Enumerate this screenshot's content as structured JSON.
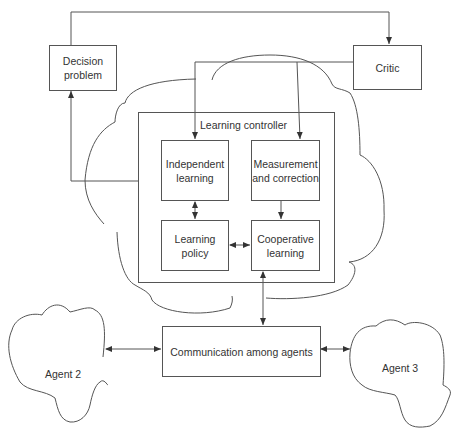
{
  "diagram": {
    "nodes": {
      "decision_problem": {
        "label": "Decision\nproblem"
      },
      "critic": {
        "label": "Critic"
      },
      "learning_controller": {
        "label": "Learning controller"
      },
      "independent_learning": {
        "label": "Independent\nlearning"
      },
      "measurement_correction": {
        "label": "Measurement\nand correction"
      },
      "learning_policy": {
        "label": "Learning\npolicy"
      },
      "cooperative_learning": {
        "label": "Cooperative\nlearning"
      },
      "communication": {
        "label": "Communication among agents"
      },
      "agent2": {
        "label": "Agent 2"
      },
      "agent3": {
        "label": "Agent 3"
      }
    },
    "edges": [
      {
        "from": "decision_problem",
        "to": "critic",
        "type": "arrow"
      },
      {
        "from": "critic",
        "to": "independent_learning",
        "type": "arrow"
      },
      {
        "from": "critic",
        "to": "measurement_correction",
        "type": "arrow"
      },
      {
        "from": "learning_controller",
        "to": "decision_problem",
        "type": "arrow"
      },
      {
        "from": "independent_learning",
        "to": "learning_policy",
        "type": "bidirectional"
      },
      {
        "from": "measurement_correction",
        "to": "cooperative_learning",
        "type": "arrow"
      },
      {
        "from": "learning_policy",
        "to": "cooperative_learning",
        "type": "bidirectional"
      },
      {
        "from": "cooperative_learning",
        "to": "communication",
        "type": "bidirectional"
      },
      {
        "from": "agent2",
        "to": "communication",
        "type": "bidirectional"
      },
      {
        "from": "communication",
        "to": "agent3",
        "type": "bidirectional"
      }
    ],
    "colors": {
      "line": "#555555",
      "text": "#333333",
      "background": "#ffffff"
    }
  }
}
